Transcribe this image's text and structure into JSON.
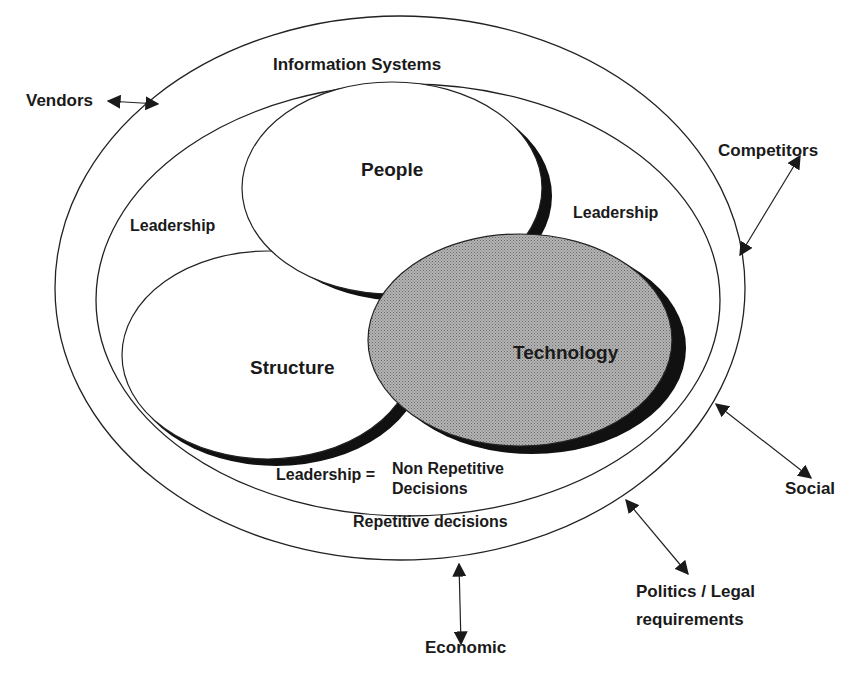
{
  "diagram": {
    "title": "Information Systems",
    "colors": {
      "line": "#222222",
      "shadow": "#111111",
      "technology_fill": "#a8a8a8",
      "background": "#ffffff"
    },
    "components": {
      "people": "People",
      "structure": "Structure",
      "technology": "Technology"
    },
    "inner_labels": {
      "leadership_left": "Leadership",
      "leadership_right": "Leadership",
      "leadership_equals": "Leadership =",
      "non_repetitive": "Non Repetitive\nDecisions",
      "repetitive": "Repetitive decisions"
    },
    "external_factors": [
      {
        "label": "Vendors"
      },
      {
        "label": "Competitors"
      },
      {
        "label": "Social"
      },
      {
        "label": "Politics / Legal\nrequirements"
      },
      {
        "label": "Economic"
      }
    ]
  }
}
